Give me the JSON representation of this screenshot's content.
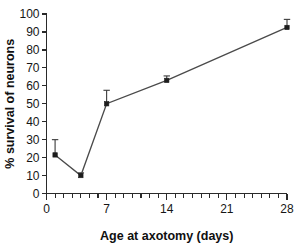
{
  "chart_data": {
    "type": "line",
    "title": "",
    "subtitle": "",
    "xlabel": "Age at axotomy (days)",
    "ylabel": "% survival of neurons",
    "xlim": [
      0,
      28
    ],
    "ylim": [
      0,
      100
    ],
    "grid": false,
    "legend": null,
    "x_ticks_major": [
      0,
      7,
      14,
      21,
      28
    ],
    "x_tick_labels": [
      "0",
      "7",
      "14",
      "21",
      "28"
    ],
    "x_minor_tick_step": 1,
    "y_ticks_major": [
      0,
      10,
      20,
      30,
      40,
      50,
      60,
      70,
      80,
      90,
      100
    ],
    "y_tick_labels": [
      "0",
      "10",
      "20",
      "30",
      "40",
      "50",
      "60",
      "70",
      "80",
      "90",
      "100"
    ],
    "series": [
      {
        "name": "neuron survival",
        "marker": "square",
        "x": [
          1,
          4,
          7,
          14,
          28
        ],
        "values": [
          21.5,
          10,
          50,
          63,
          92.5
        ],
        "err_upper": [
          8.5,
          1.5,
          7.5,
          2.5,
          4.5
        ],
        "err_lower": [
          0,
          0,
          0,
          0,
          0
        ]
      }
    ]
  },
  "colors": {
    "line": "#4a4a4a",
    "marker": "#1d1d1d",
    "error_bar": "#3a3a3a",
    "axis": "#2a2a2a",
    "text": "#161616",
    "background": "#ffffff"
  }
}
